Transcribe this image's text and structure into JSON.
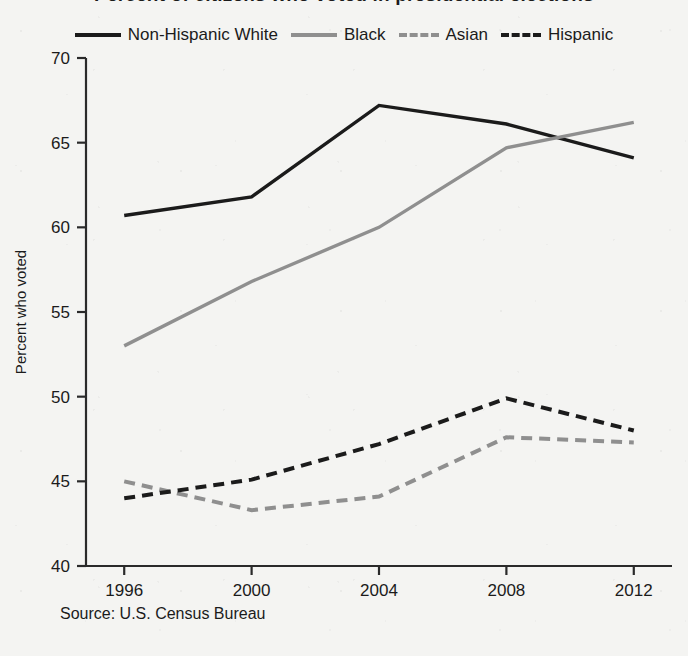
{
  "figure": {
    "title": "Percent of citizens who voted in presidential elections",
    "source_note": "Source: U.S. Census Bureau"
  },
  "legend": {
    "position": "top-center",
    "items": [
      {
        "label": "Non-Hispanic White",
        "color": "#1b1b1b",
        "style": "solid",
        "swatch_name": "legend-swatch-non-hispanic-white"
      },
      {
        "label": "Black",
        "color": "#8f8f8f",
        "style": "solid",
        "swatch_name": "legend-swatch-black"
      },
      {
        "label": "Asian",
        "color": "#8f8f8f",
        "style": "dashed",
        "swatch_name": "legend-swatch-asian"
      },
      {
        "label": "Hispanic",
        "color": "#1b1b1b",
        "style": "dashed",
        "swatch_name": "legend-swatch-hispanic"
      }
    ]
  },
  "axes": {
    "y_title": "Percent who voted",
    "x_title": "",
    "y_ticks": [
      "70",
      "65",
      "60",
      "55",
      "50",
      "45",
      "40"
    ],
    "x_ticks": [
      "1996",
      "2000",
      "2004",
      "2008",
      "2012"
    ]
  },
  "chart_data": {
    "type": "line",
    "title": "Percent of citizens who voted in presidential elections",
    "xlabel": "",
    "ylabel": "Percent who voted",
    "x": [
      1996,
      2000,
      2004,
      2008,
      2012
    ],
    "categories": [
      "1996",
      "2000",
      "2004",
      "2008",
      "2012"
    ],
    "xlim": [
      1994.8,
      2013.2
    ],
    "ylim": [
      40,
      70
    ],
    "ytick_step": 5,
    "grid": false,
    "legend_position": "top-center",
    "series": [
      {
        "name": "Non-Hispanic White",
        "color": "#1b1b1b",
        "style": "solid",
        "values": [
          60.7,
          61.8,
          67.2,
          66.1,
          64.1
        ]
      },
      {
        "name": "Black",
        "color": "#8f8f8f",
        "style": "solid",
        "values": [
          53.0,
          56.8,
          60.0,
          64.7,
          66.2
        ]
      },
      {
        "name": "Asian",
        "color": "#8f8f8f",
        "style": "dashed",
        "values": [
          45.0,
          43.3,
          44.1,
          47.6,
          47.3
        ]
      },
      {
        "name": "Hispanic",
        "color": "#1b1b1b",
        "style": "dashed",
        "values": [
          44.0,
          45.1,
          47.2,
          49.9,
          48.0
        ]
      }
    ]
  }
}
